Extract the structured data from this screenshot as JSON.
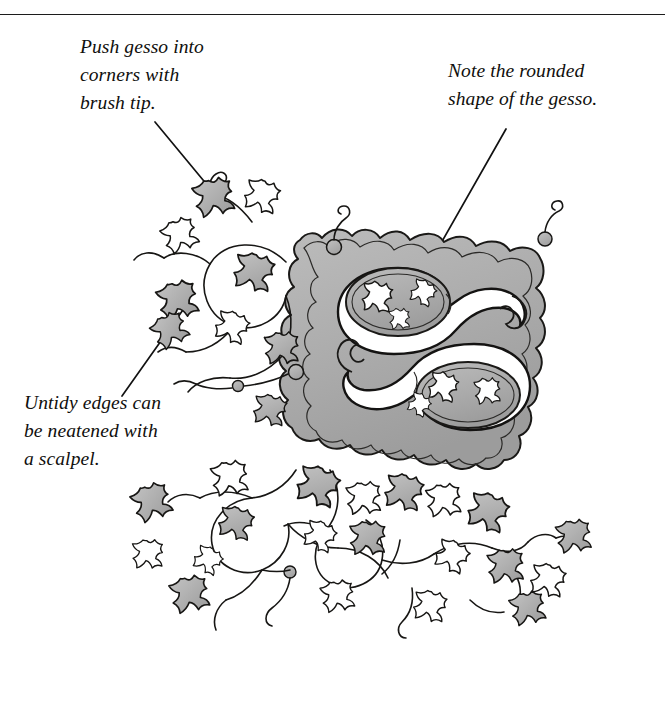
{
  "page": {
    "background_color": "#ffffff",
    "ink_color": "#100f0d",
    "wash_color": "#b0b0b0",
    "wash_color_dark": "#9a9a9a"
  },
  "rule": {
    "name": "top-horizontal-rule",
    "color": "#1c1c1c"
  },
  "captions": [
    {
      "id": "cap-gesso",
      "text": "Push gesso into\ncorners with\nbrush tip.",
      "leader_from": [
        155,
        122
      ],
      "leader_to": [
        207,
        185
      ]
    },
    {
      "id": "cap-rounded",
      "text": "Note the rounded\nshape of the gesso.",
      "leader_from": [
        506,
        129
      ],
      "leader_to": [
        432,
        259
      ]
    },
    {
      "id": "cap-untidy",
      "text": "Untidy edges can\nbe neatened with\na scalpel.",
      "leader_from": [
        122,
        396
      ],
      "leader_to": [
        184,
        308
      ]
    }
  ],
  "illustration": {
    "name": "illuminated-initial-letter-s",
    "letter": "S",
    "description": "Pen-and-ink drawing of a gilded illuminated initial letter S set in a shaped panel, surrounded by ivy-leaf vine scrollwork with gray wash shading.",
    "panel": {
      "left": 288,
      "top": 228,
      "right": 548,
      "bottom": 470
    }
  }
}
